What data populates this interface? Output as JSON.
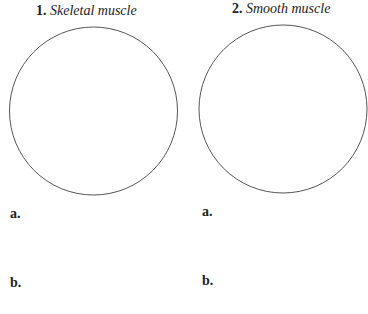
{
  "panels": [
    {
      "number": "1.",
      "title": "Skeletal muscle",
      "answers": [
        "a.",
        "b."
      ]
    },
    {
      "number": "2.",
      "title": "Smooth muscle",
      "answers": [
        "a.",
        "b."
      ]
    }
  ],
  "colors": {
    "circle_stroke": "#555555",
    "text": "#222222"
  }
}
